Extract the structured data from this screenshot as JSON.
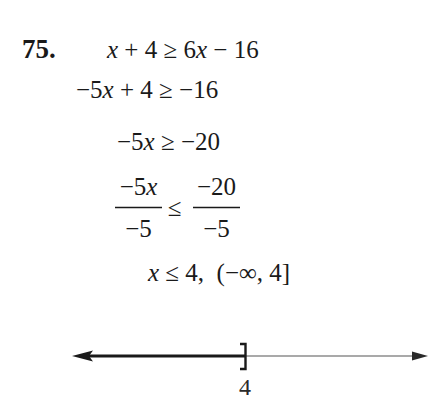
{
  "problem": {
    "number": "75.",
    "steps": [
      {
        "parts": [
          {
            "t": "x",
            "i": true
          },
          {
            "t": " + 4 ≥ 6"
          },
          {
            "t": "x",
            "i": true
          },
          {
            "t": " − 16"
          }
        ]
      },
      {
        "parts": [
          {
            "t": "−5"
          },
          {
            "t": "x",
            "i": true
          },
          {
            "t": " + 4 ≥ −16"
          }
        ]
      },
      {
        "parts": [
          {
            "t": "−5"
          },
          {
            "t": "x",
            "i": true
          },
          {
            "t": " ≥ −20"
          }
        ]
      },
      {
        "fraction_step": true,
        "left": {
          "numerator": "−5x",
          "numerator_prefix": "−5",
          "numerator_var": "x",
          "denominator": "−5"
        },
        "relation": "≤",
        "right": {
          "numerator": "−20",
          "denominator": "−5"
        }
      },
      {
        "parts": [
          {
            "t": "x",
            "i": true
          },
          {
            "t": " ≤ 4,  "
          },
          {
            "t": "(−∞, 4]"
          }
        ]
      }
    ],
    "line_texts": [
      "x + 4 ≥ 6x − 16",
      "−5x + 4 ≥ −16",
      "−5x ≥ −20",
      "−5x/−5 ≤ −20/−5",
      "x ≤ 4, (−∞, 4]"
    ],
    "solution": {
      "inequality": "x ≤ 4",
      "interval": "(−∞, 4]"
    }
  },
  "number_line": {
    "boundary_label": "4",
    "boundary_type": "closed-bracket",
    "shaded_direction": "left",
    "colors": {
      "shaded": "#1a1a1a",
      "axis": "#555555"
    }
  }
}
